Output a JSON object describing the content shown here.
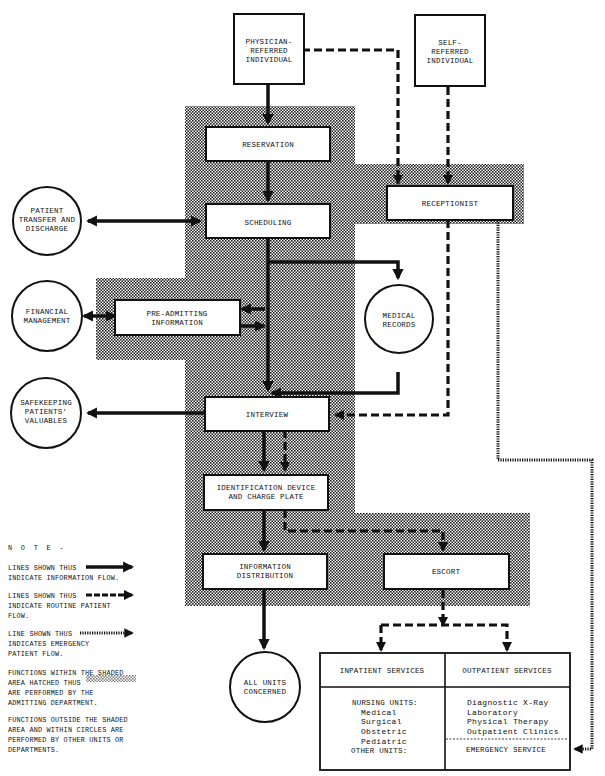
{
  "colors": {
    "ink": "#111111",
    "paper": "#ffffff",
    "hatch": "#222222"
  },
  "nodes": {
    "physician_referred": [
      "PHYSICIAN-",
      "REFERRED",
      "INDIVIDUAL"
    ],
    "self_referred": [
      "SELF-",
      "REFERRED",
      "INDIVIDUAL"
    ],
    "reservation": "RESERVATION",
    "receptionist": "RECEPTIONIST",
    "scheduling": "SCHEDULING",
    "patient_transfer": [
      "PATIENT",
      "TRANSFER AND",
      "DISCHARGE"
    ],
    "financial_management": [
      "FINANCIAL",
      "MANAGEMENT"
    ],
    "pre_admitting": [
      "PRE-ADMITTING",
      "INFORMATION"
    ],
    "medical_records": [
      "MEDICAL",
      "RECORDS"
    ],
    "safekeeping": [
      "SAFEKEEPING",
      "PATIENTS'",
      "VALUABLES"
    ],
    "interview": "INTERVIEW",
    "identification": [
      "IDENTIFICATION DEVICE",
      "AND CHARGE PLATE"
    ],
    "information_distribution": [
      "INFORMATION",
      "DISTRIBUTION"
    ],
    "escort": "ESCORT",
    "all_units": [
      "ALL UNITS",
      "CONCERNED"
    ]
  },
  "services_table": {
    "inpatient_header": "INPATIENT SERVICES",
    "outpatient_header": "OUTPATIENT SERVICES",
    "inpatient_items": [
      "NURSING UNITS:",
      "Medical",
      "Surgical",
      "Obstetric",
      "Pediatric",
      "OTHER UNITS:"
    ],
    "outpatient_items": [
      "Diagnostic X-Ray",
      "Laboratory",
      "Physical Therapy",
      "Outpatient Clinics"
    ],
    "emergency": "EMERGENCY SERVICE"
  },
  "notes": {
    "heading": "N  O  T  E  -",
    "info_flow": "LINES SHOWN THUS\nINDICATE INFORMATION FLOW.",
    "routine_flow": "LINES SHOWN THUS\nINDICATE ROUTINE PATIENT\nFLOW.",
    "emergency_flow": "LINE SHOWN THUS\nINDICATES EMERGENCY\nPATIENT FLOW.",
    "shaded_area": "FUNCTIONS WITHIN THE SHADED\nAREA HATCHED THUS\nARE PERFORMED BY THE\nADMITTING DEPARTMENT.",
    "outside_area": "FUNCTIONS OUTSIDE THE SHADED\nAREA AND WITHIN CIRCLES ARE\nPERFORMED BY OTHER UNITS OR\nDEPARTMENTS."
  }
}
